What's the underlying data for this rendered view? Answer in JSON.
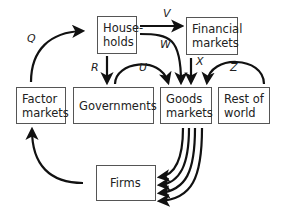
{
  "diagram": {
    "type": "flow-of-funds",
    "nodes": {
      "households": {
        "line1": "House-",
        "line2": "holds"
      },
      "financial_markets": {
        "line1": "Financial",
        "line2": "markets"
      },
      "factor_markets": {
        "line1": "Factor",
        "line2": "markets"
      },
      "governments": {
        "line1": "Governments"
      },
      "goods_markets": {
        "line1": "Goods",
        "line2": "markets"
      },
      "rest_of_world": {
        "line1": "Rest of",
        "line2": "world"
      },
      "firms": {
        "line1": "Firms"
      }
    },
    "flows": {
      "Q": "Q",
      "R": "R",
      "U": "U",
      "V": "V",
      "W": "W",
      "X": "X",
      "Z": "Z"
    },
    "edges": [
      {
        "label": "Q",
        "from": "Factor markets",
        "to": "Households"
      },
      {
        "label": "R",
        "from": "Households",
        "to": "Governments"
      },
      {
        "label": "U",
        "from": "Governments",
        "to": "Goods markets"
      },
      {
        "label": "V",
        "from": "Households",
        "to": "Financial markets"
      },
      {
        "label": "W",
        "from": "Households",
        "to": "Goods markets"
      },
      {
        "label": "X",
        "from": "Financial markets",
        "to": "Goods markets"
      },
      {
        "label": "Z",
        "from": "Rest of world",
        "to": "Goods markets"
      },
      {
        "label": "",
        "from": "Goods markets",
        "to": "Firms",
        "count": 4
      },
      {
        "label": "",
        "from": "Firms",
        "to": "Factor markets"
      }
    ],
    "colors": {
      "stroke": "#111111",
      "box_border": "#555555"
    }
  }
}
